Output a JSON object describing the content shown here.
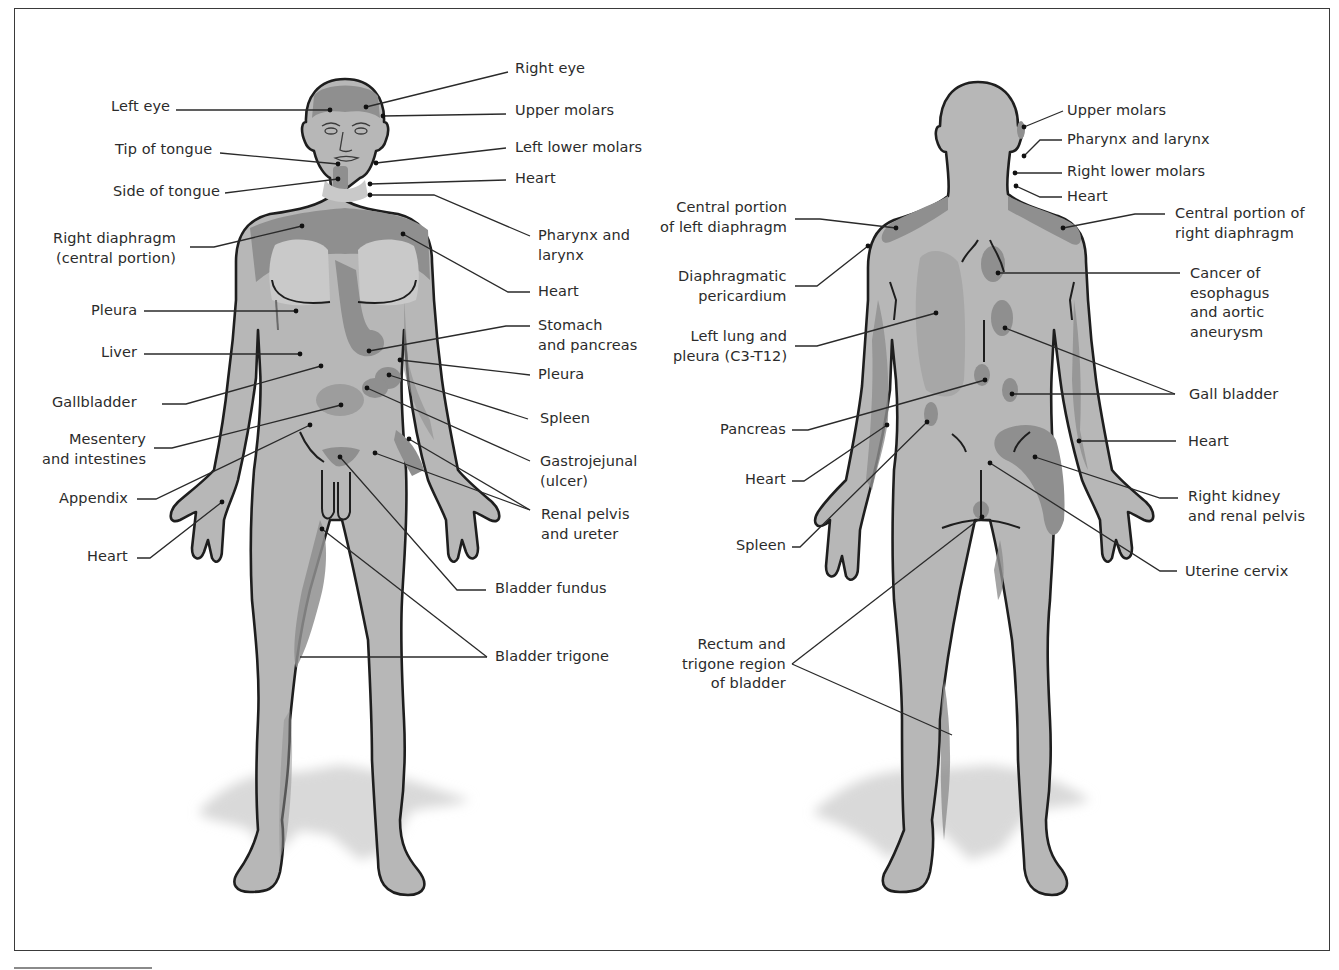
{
  "figure": {
    "colors": {
      "skin": "#b7b7b7",
      "referred_zone": "#8f8f8f",
      "referred_zone_dark": "#7d7d7d",
      "light_zone": "#c9c9c9",
      "outline": "#1e1e1e",
      "leader": "#2a2a2a",
      "text": "#2b2b2b",
      "shadow": "#d6d6d6",
      "frame": "#3a3a3a"
    }
  },
  "anterior": {
    "view": "front",
    "labels": [
      {
        "id": "left-eye",
        "text": "Left eye",
        "x": 170,
        "y": 97,
        "align": "r",
        "line": [
          [
            176,
            110
          ],
          [
            330,
            110
          ]
        ],
        "dot": [
          330,
          110
        ]
      },
      {
        "id": "tip-of-tongue",
        "text": "Tip of tongue",
        "x": 212,
        "y": 140,
        "align": "r",
        "line": [
          [
            220,
            153
          ],
          [
            338,
            164
          ]
        ],
        "dot": [
          338,
          164
        ]
      },
      {
        "id": "side-of-tongue",
        "text": "Side of tongue",
        "x": 220,
        "y": 182,
        "align": "r",
        "line": [
          [
            225,
            193
          ],
          [
            338,
            179
          ]
        ],
        "dot": [
          338,
          179
        ]
      },
      {
        "id": "right-diaphragm",
        "text": "Right diaphragm\n(central portion)",
        "x": 176,
        "y": 229,
        "align": "r",
        "line": [
          [
            190,
            247
          ],
          [
            214,
            247
          ],
          [
            302,
            226
          ]
        ],
        "dot": [
          302,
          226
        ]
      },
      {
        "id": "pleura-left",
        "text": "Pleura",
        "x": 137,
        "y": 301,
        "align": "r",
        "line": [
          [
            144,
            311
          ],
          [
            296,
            311
          ]
        ],
        "dot": [
          296,
          311
        ]
      },
      {
        "id": "liver",
        "text": "Liver",
        "x": 137,
        "y": 343,
        "align": "r",
        "line": [
          [
            144,
            354
          ],
          [
            300,
            354
          ]
        ],
        "dot": [
          300,
          354
        ]
      },
      {
        "id": "gallbladder",
        "text": "Gallbladder",
        "x": 137,
        "y": 393,
        "align": "r",
        "line": [
          [
            162,
            404
          ],
          [
            186,
            404
          ],
          [
            321,
            366
          ]
        ],
        "dot": [
          321,
          366
        ]
      },
      {
        "id": "mesentery",
        "text": "Mesentery\nand intestines",
        "x": 146,
        "y": 430,
        "align": "r",
        "line": [
          [
            154,
            448
          ],
          [
            172,
            448
          ],
          [
            341,
            405
          ]
        ],
        "dot": [
          341,
          405
        ]
      },
      {
        "id": "appendix",
        "text": "Appendix",
        "x": 128,
        "y": 489,
        "align": "r",
        "line": [
          [
            137,
            499
          ],
          [
            156,
            499
          ],
          [
            310,
            425
          ]
        ],
        "dot": [
          310,
          425
        ]
      },
      {
        "id": "heart-hand",
        "text": "Heart",
        "x": 128,
        "y": 547,
        "align": "r",
        "line": [
          [
            137,
            558
          ],
          [
            150,
            558
          ],
          [
            222,
            502
          ]
        ],
        "dot": [
          222,
          502
        ]
      },
      {
        "id": "right-eye",
        "text": "Right eye",
        "x": 515,
        "y": 59,
        "align": "l",
        "line": [
          [
            508,
            72
          ],
          [
            366,
            107
          ]
        ],
        "dot": [
          366,
          107
        ]
      },
      {
        "id": "upper-molars",
        "text": "Upper molars",
        "x": 515,
        "y": 101,
        "align": "l",
        "line": [
          [
            506,
            114
          ],
          [
            383,
            116
          ]
        ],
        "dot": [
          383,
          116
        ]
      },
      {
        "id": "left-lower-molars",
        "text": "Left lower molars",
        "x": 515,
        "y": 138,
        "align": "l",
        "line": [
          [
            506,
            148
          ],
          [
            376,
            163
          ]
        ],
        "dot": [
          376,
          163
        ]
      },
      {
        "id": "heart-neck",
        "text": "Heart",
        "x": 515,
        "y": 169,
        "align": "l",
        "line": [
          [
            506,
            180
          ],
          [
            370,
            184
          ]
        ],
        "dot": [
          370,
          184
        ]
      },
      {
        "id": "pharynx-larynx",
        "text": "Pharynx and\nlarynx",
        "x": 538,
        "y": 226,
        "align": "l",
        "line": [
          [
            530,
            236
          ],
          [
            434,
            195
          ],
          [
            370,
            195
          ]
        ],
        "dot": [
          370,
          195
        ]
      },
      {
        "id": "heart-chest",
        "text": "Heart",
        "x": 538,
        "y": 282,
        "align": "l",
        "line": [
          [
            530,
            292
          ],
          [
            508,
            292
          ],
          [
            403,
            234
          ]
        ],
        "dot": [
          403,
          234
        ]
      },
      {
        "id": "stomach-pancreas",
        "text": "Stomach\nand pancreas",
        "x": 538,
        "y": 316,
        "align": "l",
        "line": [
          [
            530,
            326
          ],
          [
            506,
            326
          ],
          [
            369,
            351
          ]
        ],
        "dot": [
          369,
          351
        ]
      },
      {
        "id": "pleura-right",
        "text": "Pleura",
        "x": 538,
        "y": 365,
        "align": "l",
        "line": [
          [
            530,
            375
          ],
          [
            400,
            360
          ]
        ],
        "dot": [
          400,
          360
        ]
      },
      {
        "id": "spleen",
        "text": "Spleen",
        "x": 540,
        "y": 409,
        "align": "l",
        "line": [
          [
            528,
            419
          ],
          [
            389,
            375
          ]
        ],
        "dot": [
          389,
          375
        ]
      },
      {
        "id": "gastrojejunal",
        "text": "Gastrojejunal\n(ulcer)",
        "x": 540,
        "y": 452,
        "align": "l",
        "line": [
          [
            530,
            461
          ],
          [
            367,
            388
          ]
        ],
        "dot": [
          367,
          388
        ]
      },
      {
        "id": "renal-pelvis-ureter",
        "text": "Renal pelvis\nand ureter",
        "x": 541,
        "y": 505,
        "align": "l",
        "line": [
          [
            530,
            510
          ],
          [
            409,
            439
          ]
        ],
        "dot": [
          409,
          439
        ],
        "line2": [
          [
            530,
            510
          ],
          [
            375,
            453
          ]
        ],
        "dot2": [
          375,
          453
        ]
      },
      {
        "id": "bladder-fundus",
        "text": "Bladder fundus",
        "x": 495,
        "y": 579,
        "align": "l",
        "line": [
          [
            486,
            590
          ],
          [
            457,
            590
          ],
          [
            340,
            457
          ]
        ],
        "dot": [
          340,
          457
        ]
      },
      {
        "id": "bladder-trigone",
        "text": "Bladder trigone",
        "x": 495,
        "y": 647,
        "align": "l",
        "line": [
          [
            487,
            657
          ],
          [
            300,
            657
          ]
        ],
        "line2": [
          [
            487,
            657
          ],
          [
            322,
            529
          ]
        ],
        "dot2": [
          322,
          529
        ]
      }
    ]
  },
  "posterior": {
    "view": "back",
    "labels": [
      {
        "id": "upper-molars-back",
        "text": "Upper molars",
        "x": 1067,
        "y": 101,
        "align": "l",
        "line": [
          [
            1063,
            111
          ],
          [
            1024,
            127
          ]
        ],
        "dot": [
          1024,
          127
        ]
      },
      {
        "id": "pharynx-larynx-back",
        "text": "Pharynx and larynx",
        "x": 1067,
        "y": 130,
        "align": "l",
        "line": [
          [
            1062,
            140
          ],
          [
            1040,
            140
          ],
          [
            1024,
            156
          ]
        ],
        "dot": [
          1024,
          156
        ]
      },
      {
        "id": "right-lower-molars",
        "text": "Right lower molars",
        "x": 1067,
        "y": 162,
        "align": "l",
        "line": [
          [
            1062,
            173
          ],
          [
            1015,
            173
          ]
        ],
        "dot": [
          1015,
          173
        ]
      },
      {
        "id": "heart-neck-back",
        "text": "Heart",
        "x": 1067,
        "y": 187,
        "align": "l",
        "line": [
          [
            1062,
            197
          ],
          [
            1040,
            197
          ],
          [
            1016,
            186
          ]
        ],
        "dot": [
          1016,
          186
        ]
      },
      {
        "id": "right-diaphragm-back",
        "text": "Central portion of\nright diaphragm",
        "x": 1175,
        "y": 204,
        "align": "l",
        "line": [
          [
            1165,
            214
          ],
          [
            1135,
            214
          ],
          [
            1063,
            228
          ]
        ],
        "dot": [
          1063,
          228
        ]
      },
      {
        "id": "left-diaphragm-back",
        "text": "Central portion\nof left diaphragm",
        "x": 787,
        "y": 198,
        "align": "r",
        "line": [
          [
            795,
            219
          ],
          [
            820,
            219
          ],
          [
            896,
            228
          ]
        ],
        "dot": [
          896,
          228
        ]
      },
      {
        "id": "diaphragmatic-pericardium",
        "text": "Diaphragmatic\npericardium",
        "x": 787,
        "y": 267,
        "align": "r",
        "line": [
          [
            795,
            286
          ],
          [
            817,
            286
          ],
          [
            868,
            246
          ]
        ],
        "dot": [
          868,
          246
        ]
      },
      {
        "id": "left-lung-pleura",
        "text": "Left lung and\npleura (C3-T12)",
        "x": 787,
        "y": 327,
        "align": "r",
        "line": [
          [
            795,
            346
          ],
          [
            817,
            346
          ],
          [
            936,
            313
          ]
        ],
        "dot": [
          936,
          313
        ]
      },
      {
        "id": "cancer-esophagus",
        "text": "Cancer of\nesophagus\nand aortic\naneurysm",
        "x": 1190,
        "y": 264,
        "align": "l",
        "line": [
          [
            1180,
            273
          ],
          [
            998,
            273
          ]
        ],
        "dot": [
          998,
          273
        ]
      },
      {
        "id": "gall-bladder-back",
        "text": "Gall bladder",
        "x": 1189,
        "y": 385,
        "align": "l",
        "line": [
          [
            1175,
            394
          ],
          [
            1005,
            328
          ]
        ],
        "dot": [
          1005,
          328
        ],
        "line2": [
          [
            1175,
            394
          ],
          [
            1012,
            394
          ]
        ],
        "dot2": [
          1012,
          394
        ]
      },
      {
        "id": "pancreas-back",
        "text": "Pancreas",
        "x": 786,
        "y": 420,
        "align": "r",
        "line": [
          [
            792,
            430
          ],
          [
            808,
            430
          ],
          [
            985,
            380
          ]
        ],
        "dot": [
          985,
          380
        ]
      },
      {
        "id": "heart-arm-back",
        "text": "Heart",
        "x": 786,
        "y": 470,
        "align": "r",
        "line": [
          [
            792,
            481
          ],
          [
            804,
            481
          ],
          [
            887,
            425
          ]
        ],
        "dot": [
          887,
          425
        ]
      },
      {
        "id": "spleen-back",
        "text": "Spleen",
        "x": 786,
        "y": 536,
        "align": "r",
        "line": [
          [
            792,
            547
          ],
          [
            800,
            547
          ],
          [
            927,
            422
          ]
        ],
        "dot": [
          927,
          422
        ]
      },
      {
        "id": "heart-arm-right-back",
        "text": "Heart",
        "x": 1188,
        "y": 432,
        "align": "l",
        "line": [
          [
            1176,
            441
          ],
          [
            1079,
            441
          ]
        ],
        "dot": [
          1079,
          441
        ]
      },
      {
        "id": "right-kidney",
        "text": "Right kidney\nand renal pelvis",
        "x": 1188,
        "y": 487,
        "align": "l",
        "line": [
          [
            1178,
            498
          ],
          [
            1160,
            498
          ],
          [
            1035,
            457
          ]
        ],
        "dot": [
          1035,
          457
        ]
      },
      {
        "id": "uterine-cervix",
        "text": "Uterine cervix",
        "x": 1185,
        "y": 562,
        "align": "l",
        "line": [
          [
            1177,
            571
          ],
          [
            1160,
            571
          ],
          [
            990,
            463
          ]
        ],
        "dot": [
          990,
          463
        ]
      },
      {
        "id": "rectum-trigone",
        "text": "Rectum and\ntrigone region\nof bladder",
        "x": 786,
        "y": 635,
        "align": "r",
        "line": [
          [
            792,
            664
          ],
          [
            982,
            517
          ]
        ],
        "dot": [
          982,
          517
        ],
        "line2": [
          [
            792,
            664
          ],
          [
            952,
            735
          ]
        ]
      }
    ]
  }
}
